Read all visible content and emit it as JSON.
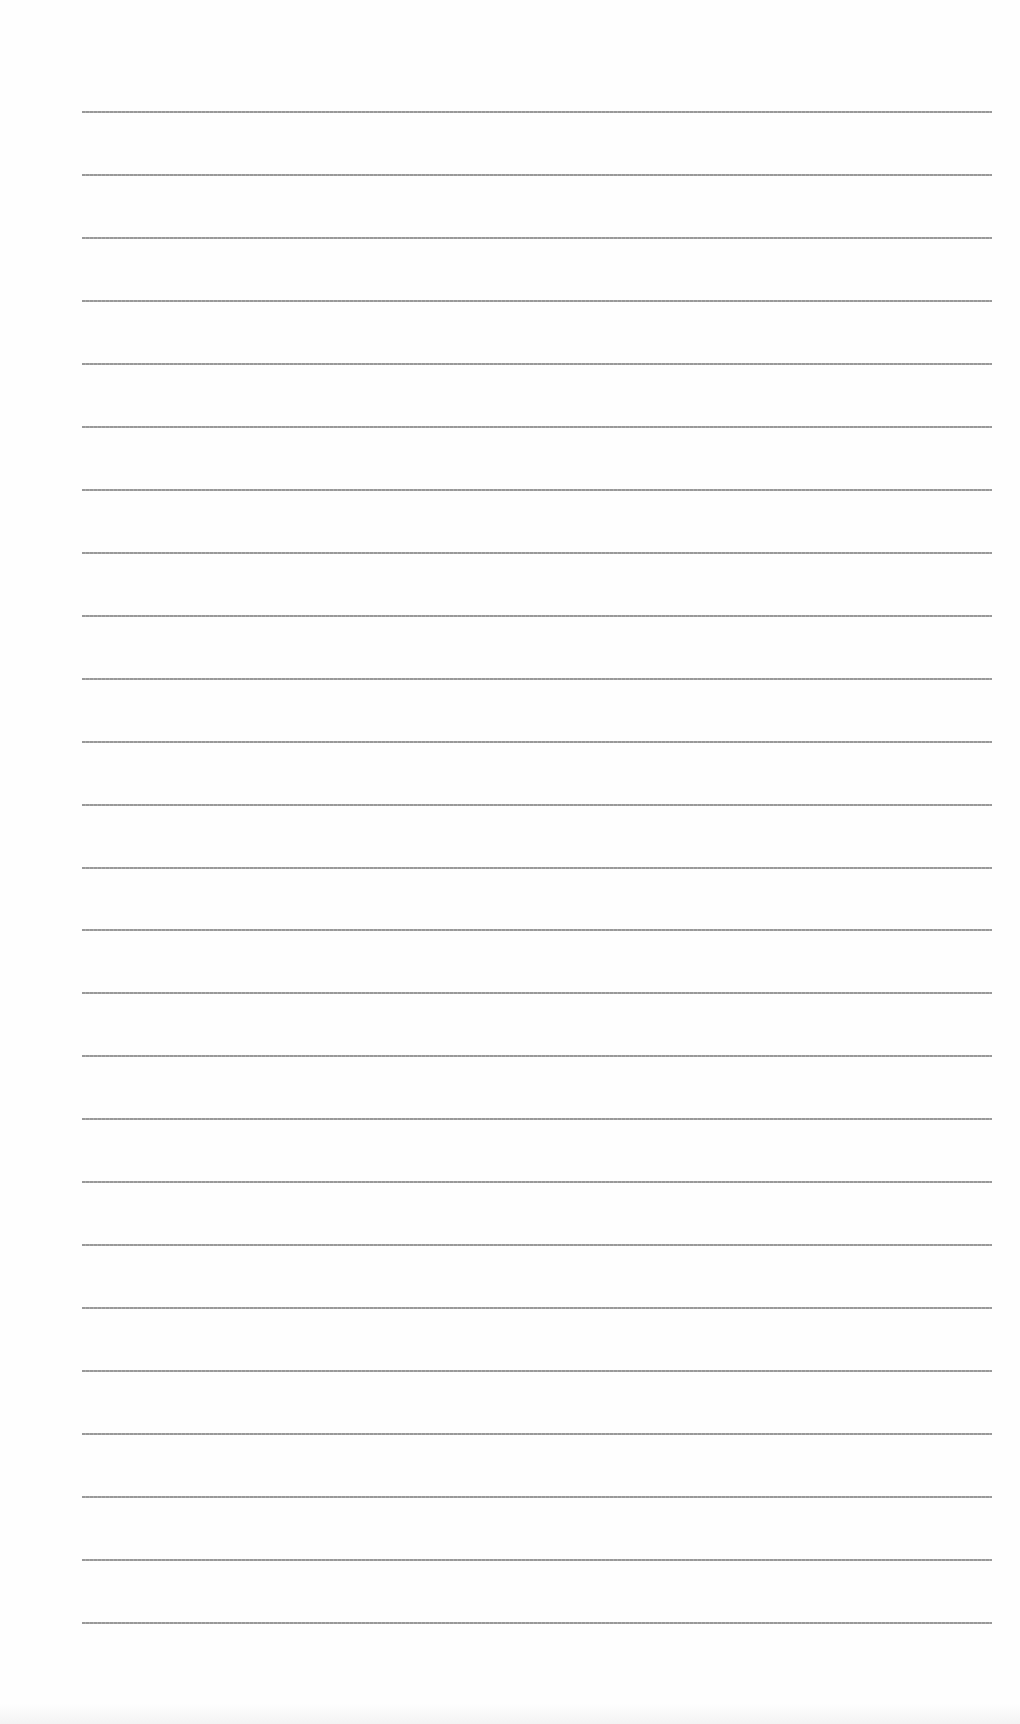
{
  "document": {
    "type": "lined-paper",
    "background_color": "#fefefe",
    "rule_color": "#8d8d8d",
    "rule_count": 25,
    "rule_start_y": 111,
    "rule_spacing": 62.96,
    "rule_left_x": 82,
    "rule_right_x": 992
  }
}
